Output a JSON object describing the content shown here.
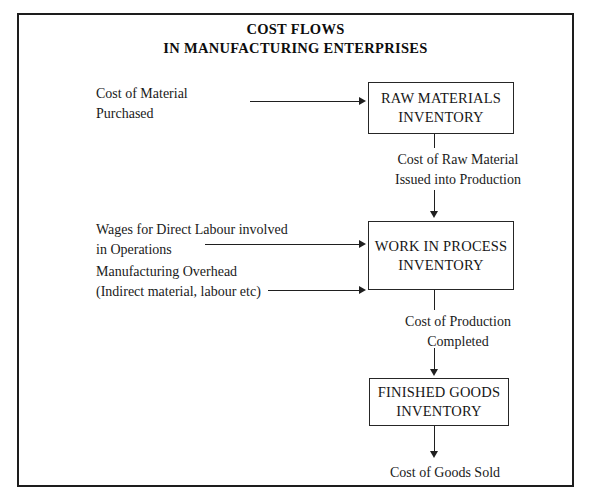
{
  "diagram": {
    "title": {
      "line1": "COST FLOWS",
      "line2": "IN MANUFACTURING ENTERPRISES"
    },
    "boxes": [
      {
        "id": "raw-materials",
        "line1": "RAW MATERIALS",
        "line2": "INVENTORY"
      },
      {
        "id": "work-process",
        "line1": "WORK IN PROCESS",
        "line2": "INVENTORY"
      },
      {
        "id": "finished-goods",
        "line1": "FINISHED GOODS",
        "line2": "INVENTORY"
      }
    ],
    "inputs": [
      {
        "id": "material-purchased",
        "line1": "Cost of Material",
        "line2": "Purchased"
      },
      {
        "id": "wages-labour",
        "line1": "Wages for Direct Labour involved",
        "line2": " in Operations"
      },
      {
        "id": "manufacturing-overhead",
        "line1": "Manufacturing Overhead",
        "line2": "(Indirect material, labour etc)"
      }
    ],
    "flow_labels": [
      {
        "id": "raw-issued",
        "line1": "Cost of Raw Material",
        "line2": "Issued into Production"
      },
      {
        "id": "prod-completed",
        "line1": "Cost of Production",
        "line2": "Completed"
      }
    ],
    "output": {
      "id": "cost-of-goods-sold",
      "text": "Cost of Goods Sold"
    },
    "colors": {
      "ink": "#1a1a1a",
      "frame": "#1d1d1d",
      "page": "#ffffff"
    }
  }
}
